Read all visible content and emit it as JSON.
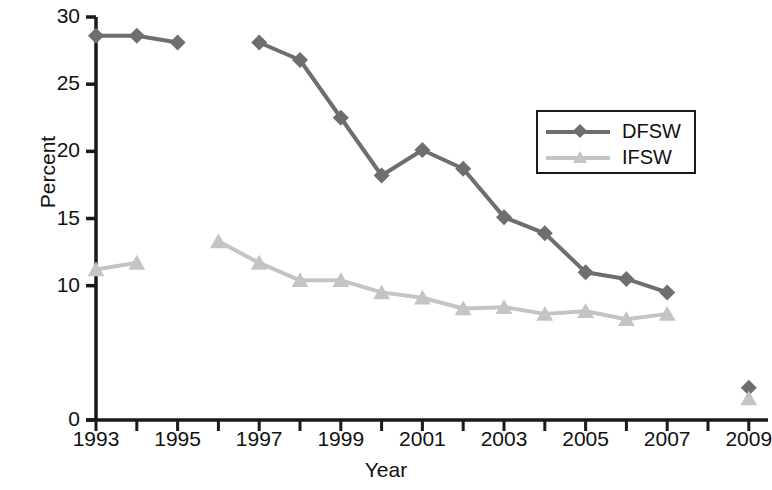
{
  "chart_data": {
    "type": "line",
    "title": "",
    "xlabel": "Year",
    "ylabel": "Percent",
    "xlim": [
      1992.5,
      2009.8
    ],
    "ylim": [
      0,
      30
    ],
    "yticks": [
      0,
      10,
      15,
      20,
      25,
      30
    ],
    "ytick_labels": [
      "0",
      "10",
      "15",
      "20",
      "25",
      "30"
    ],
    "xticks": [
      1993,
      1994,
      1995,
      1996,
      1997,
      1998,
      1999,
      2000,
      2001,
      2002,
      2003,
      2004,
      2005,
      2006,
      2007,
      2008,
      2009
    ],
    "xtick_labels": [
      "1993",
      "1995",
      "1997",
      "1999",
      "2001",
      "2003",
      "2005",
      "2007",
      "2009"
    ],
    "xtick_label_years": [
      1993,
      1995,
      1997,
      1999,
      2001,
      2003,
      2005,
      2007,
      2009
    ],
    "grid": false,
    "legend_position": "upper right",
    "series": [
      {
        "name": "DFSW",
        "color": "#6e6e6e",
        "marker": "diamond",
        "segments": [
          {
            "x": [
              1993,
              1994,
              1995
            ],
            "values": [
              28.6,
              28.6,
              28.1
            ]
          },
          {
            "x": [
              1997,
              1998,
              1999,
              2000,
              2001,
              2002,
              2003,
              2004,
              2005,
              2006,
              2007
            ],
            "values": [
              28.1,
              26.8,
              22.5,
              18.2,
              20.1,
              18.7,
              15.1,
              13.9,
              11.0,
              10.5,
              9.5
            ]
          },
          {
            "x": [
              2009
            ],
            "values": [
              2.4
            ]
          }
        ]
      },
      {
        "name": "IFSW",
        "color": "#c4c4c4",
        "marker": "triangle",
        "segments": [
          {
            "x": [
              1993,
              1994
            ],
            "values": [
              11.2,
              11.7
            ]
          },
          {
            "x": [
              1996,
              1997,
              1998,
              1999,
              2000,
              2001,
              2002,
              2003,
              2004,
              2005,
              2006,
              2007
            ],
            "values": [
              13.3,
              11.7,
              10.4,
              10.4,
              9.5,
              9.1,
              8.3,
              8.4,
              7.9,
              8.1,
              7.5,
              7.9
            ]
          },
          {
            "x": [
              2009
            ],
            "values": [
              1.6
            ]
          }
        ]
      }
    ]
  },
  "legend": {
    "items": [
      {
        "label": "DFSW",
        "color": "#6e6e6e",
        "marker": "diamond"
      },
      {
        "label": "IFSW",
        "color": "#c4c4c4",
        "marker": "triangle"
      }
    ]
  },
  "axes": {
    "x_title": "Year",
    "y_title": "Percent"
  },
  "colors": {
    "dfsw": "#6e6e6e",
    "ifsw": "#c4c4c4",
    "axis": "#1a1a1a",
    "background": "#ffffff"
  }
}
